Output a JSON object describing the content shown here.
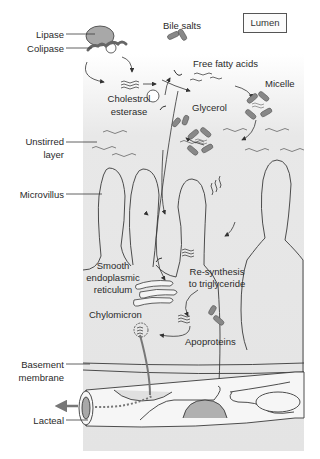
{
  "diagram": {
    "title_box": "Lumen",
    "colors": {
      "panel": "#e6e6e6",
      "panel_fade": "#ffffff",
      "enzyme_fill": "#a8a8a8",
      "protein_fill": "#8a8a8a",
      "outline": "#3a3a3a",
      "arrow": "#333333",
      "lacteal_arrow": "#777777",
      "blood_cell": "#b0b0b0"
    },
    "left_labels": {
      "lipase": "Lipase",
      "colipase": "Colipase",
      "unstirred_1": "Unstirred",
      "unstirred_2": "layer",
      "microvillus": "Microvillus",
      "basement_1": "Basement",
      "basement_2": "membrane",
      "lacteal": "Lacteal"
    },
    "inner_labels": {
      "bile_salts": "Bile salts",
      "free_fatty_acids": "Free fatty acids",
      "micelle": "Micelle",
      "cholesterol_1": "Cholestrol",
      "cholesterol_2": "esterase",
      "glycerol": "Glycerol",
      "ser_1": "Smooth",
      "ser_2": "endoplasmic",
      "ser_3": "reticulum",
      "resynth_1": "Re-synthesis",
      "resynth_2": "to triglyceride",
      "chylomicron": "Chylomicron",
      "apoproteins": "Apoproteins"
    }
  }
}
